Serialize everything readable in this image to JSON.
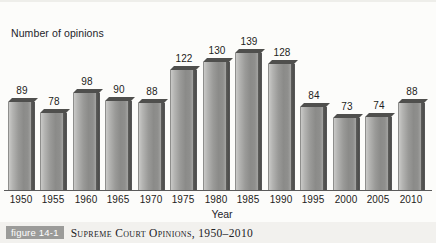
{
  "figure": {
    "badge_label": "figure 14-1",
    "caption": "Supreme Court Opinions, 1950–2010"
  },
  "chart_data": {
    "type": "bar",
    "title": "",
    "subtitle": "",
    "xlabel": "Year",
    "ylabel": "Number of opinions",
    "categories": [
      "1950",
      "1955",
      "1960",
      "1965",
      "1970",
      "1975",
      "1980",
      "1985",
      "1990",
      "1995",
      "2000",
      "2005",
      "2010"
    ],
    "values": [
      89,
      78,
      98,
      90,
      88,
      122,
      130,
      139,
      128,
      84,
      73,
      74,
      88
    ],
    "value_labels": [
      "89",
      "78",
      "98",
      "90",
      "88",
      "122",
      "130",
      "139",
      "128",
      "84",
      "73",
      "74",
      "88"
    ],
    "ylim": [
      0,
      150
    ],
    "grid": false,
    "legend": null,
    "legend_position": "none",
    "style": "3d-grayscale-bars",
    "colors": {
      "bar_front_light": "#c9c9c7",
      "bar_front_dark": "#8b8b89",
      "bar_side": "#4e4e4c",
      "bar_top": "#4f4f4d",
      "axis": "#5b5b5b",
      "text": "#1d1d22",
      "background": "#fcfcfa",
      "caption_band": "#f2f1ee",
      "badge": "#9b9b99"
    }
  }
}
